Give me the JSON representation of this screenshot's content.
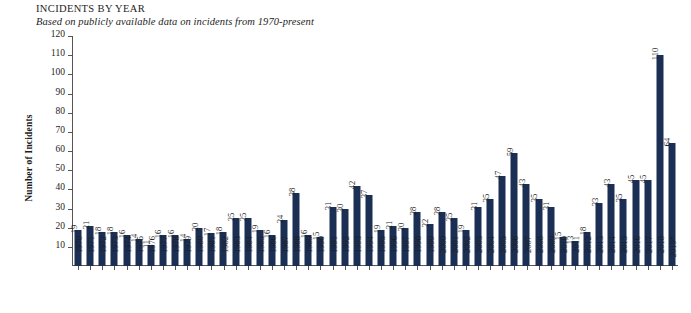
{
  "header": {
    "title": "INCIDENTS BY YEAR",
    "subtitle": "Based on publicly available data on incidents from 1970-present"
  },
  "chart_data": {
    "type": "bar",
    "title": "INCIDENTS BY YEAR",
    "subtitle": "Based on publicly available data on incidents from 1970-present",
    "xlabel": "",
    "ylabel": "Number of Incidents",
    "ylim": [
      0,
      120
    ],
    "ytick_step": 10,
    "yticks": [
      120,
      110,
      100,
      90,
      80,
      70,
      60,
      50,
      40,
      30,
      20,
      10
    ],
    "grid": false,
    "legend": false,
    "bar_color": "#1b2f55",
    "show_value_labels": true,
    "value_label_orientation": "vertical",
    "categories": [
      "1970",
      "1971",
      "1972",
      "1973",
      "1974",
      "1975",
      "1976",
      "1977",
      "1978",
      "1979",
      "1980",
      "1981",
      "1982",
      "1983",
      "1984",
      "1985",
      "1986",
      "1987",
      "1988",
      "1989",
      "1990",
      "1991",
      "1992",
      "1993",
      "1994",
      "1995",
      "1996",
      "1997",
      "1998",
      "1999",
      "2000",
      "2001",
      "2002",
      "2003",
      "2004",
      "2005",
      "2006",
      "2007",
      "2008",
      "2009",
      "2010",
      "2011",
      "2012",
      "2013",
      "2014",
      "2015",
      "2016",
      "2017",
      "2018",
      "2019*"
    ],
    "values": [
      19,
      21,
      18,
      18,
      16,
      14,
      11,
      16,
      16,
      14,
      20,
      17,
      18,
      25,
      25,
      19,
      16,
      24,
      38,
      16,
      15,
      31,
      30,
      42,
      37,
      19,
      21,
      20,
      28,
      22,
      28,
      25,
      19,
      31,
      35,
      47,
      59,
      43,
      35,
      31,
      15,
      13,
      18,
      33,
      43,
      35,
      45,
      45,
      110,
      64
    ]
  }
}
